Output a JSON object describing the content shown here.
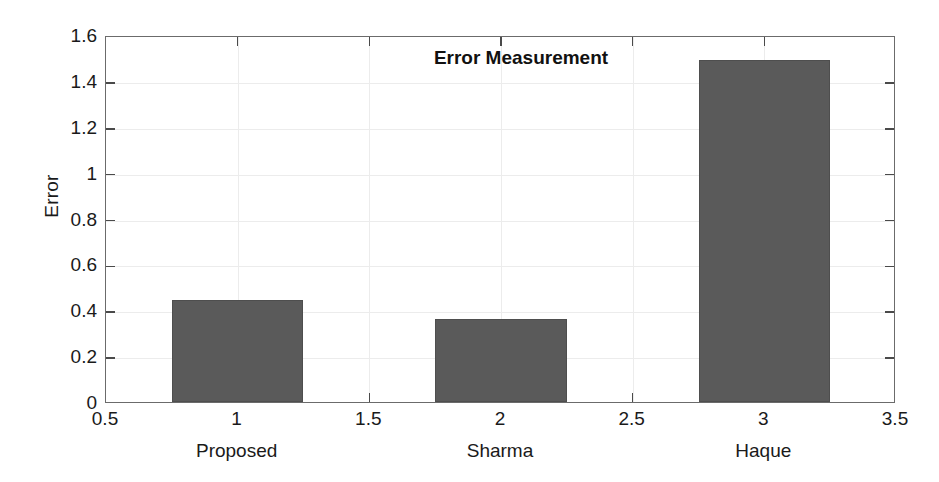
{
  "chart_data": {
    "type": "bar",
    "title": "Error Measurement",
    "xlabel": "",
    "ylabel": "Error",
    "categories": [
      "Proposed",
      "Sharma",
      "Haque"
    ],
    "x": [
      1,
      2,
      3
    ],
    "values": [
      0.445,
      0.36,
      1.49
    ],
    "bar_width": 0.5,
    "xlim": [
      0.5,
      3.5
    ],
    "ylim": [
      0,
      1.6
    ],
    "xticks": [
      0.5,
      1,
      1.5,
      2,
      2.5,
      3,
      3.5
    ],
    "xtick_labels": [
      "0.5",
      "1",
      "1.5",
      "2",
      "2.5",
      "3",
      "3.5"
    ],
    "yticks": [
      0,
      0.2,
      0.4,
      0.6,
      0.8,
      1,
      1.2,
      1.4,
      1.6
    ],
    "ytick_labels": [
      "0",
      "0.2",
      "0.4",
      "0.6",
      "0.8",
      "1",
      "1.2",
      "1.4",
      "1.6"
    ],
    "grid": true,
    "legend": null,
    "bar_color": "#5a5a5a",
    "grid_color": "#ececec",
    "axis_color": "#6b6b6b",
    "background_color": "#ffffff"
  }
}
